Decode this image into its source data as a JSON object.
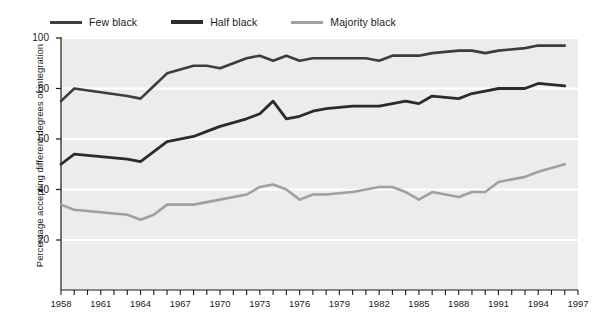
{
  "legend": {
    "position": "top-left",
    "items": [
      {
        "label": "Few black",
        "color": "#3d3d3d"
      },
      {
        "label": "Half black",
        "color": "#2b2b2b"
      },
      {
        "label": "Majority black",
        "color": "#a0a0a0"
      }
    ]
  },
  "axes": {
    "ylabel": "Percentage accepting different degrees of integration",
    "yticks": [
      20,
      40,
      60,
      80,
      100
    ],
    "ylim": [
      0,
      100
    ],
    "xticks_labeled": [
      1958,
      1961,
      1964,
      1967,
      1970,
      1973,
      1976,
      1979,
      1982,
      1985,
      1988,
      1991,
      1994,
      1997
    ],
    "xlim": [
      1958,
      1997
    ],
    "xlabel": ""
  },
  "style": {
    "plot_background": "#ececec",
    "gridline_color": "#ffffff",
    "axis_color": "#1b1b1b",
    "page_background": "#ffffff"
  },
  "chart_data": {
    "type": "line",
    "title": "",
    "xlabel": "",
    "ylabel": "Percentage accepting different degrees of integration",
    "ylim": [
      0,
      100
    ],
    "xlim": [
      1958,
      1997
    ],
    "grid": true,
    "legend_position": "top-left",
    "x": [
      1958,
      1959,
      1963,
      1964,
      1965,
      1966,
      1968,
      1969,
      1970,
      1972,
      1973,
      1974,
      1975,
      1976,
      1977,
      1978,
      1980,
      1981,
      1982,
      1983,
      1984,
      1985,
      1986,
      1988,
      1989,
      1990,
      1991,
      1993,
      1994,
      1996
    ],
    "series": [
      {
        "name": "Few black",
        "color": "#3d3d3d",
        "values": [
          75,
          80,
          77,
          76,
          81,
          86,
          89,
          89,
          88,
          92,
          93,
          91,
          93,
          91,
          92,
          92,
          92,
          92,
          91,
          93,
          93,
          93,
          94,
          95,
          95,
          94,
          95,
          96,
          97,
          97
        ]
      },
      {
        "name": "Half black",
        "color": "#2b2b2b",
        "values": [
          50,
          54,
          52,
          51,
          55,
          59,
          61,
          63,
          65,
          68,
          70,
          75,
          68,
          69,
          71,
          72,
          73,
          73,
          73,
          74,
          75,
          74,
          77,
          76,
          78,
          79,
          80,
          80,
          82,
          81
        ]
      },
      {
        "name": "Majority black",
        "color": "#a0a0a0",
        "values": [
          34,
          32,
          30,
          28,
          30,
          34,
          34,
          35,
          36,
          38,
          41,
          42,
          40,
          36,
          38,
          38,
          39,
          40,
          41,
          41,
          39,
          36,
          39,
          37,
          39,
          39,
          43,
          45,
          47,
          50
        ]
      }
    ]
  }
}
